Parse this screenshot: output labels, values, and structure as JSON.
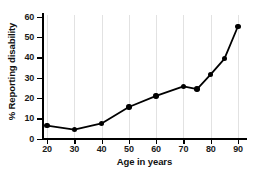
{
  "chart_data": {
    "type": "line",
    "title": "",
    "xlabel": "Age in years",
    "ylabel": "% Reporting disability",
    "x": [
      20,
      30,
      40,
      50,
      60,
      70,
      75,
      80,
      85,
      90
    ],
    "values": [
      6.3,
      4.4,
      7.4,
      15.5,
      21.0,
      25.6,
      24.3,
      31.5,
      39.2,
      55.2
    ],
    "series": [
      {
        "name": "% Reporting disability",
        "values": [
          6.3,
          4.4,
          7.4,
          15.5,
          21.0,
          25.6,
          24.3,
          31.5,
          39.2,
          55.2
        ]
      }
    ],
    "xlim": [
      20,
      90
    ],
    "ylim": [
      0,
      60
    ],
    "xticks": [
      20,
      30,
      40,
      50,
      60,
      70,
      80,
      90
    ],
    "xtick_labels": [
      "20",
      "30",
      "40",
      "50",
      "60",
      "70",
      "80",
      "90"
    ],
    "yticks": [
      0,
      10,
      20,
      30,
      40,
      50,
      60
    ],
    "ytick_labels": [
      "0",
      "10",
      "20",
      "30",
      "40",
      "50",
      "60"
    ],
    "grid": "vertical-only",
    "legend": "none",
    "marker": "filled-circle",
    "line_color": "#000000",
    "marker_color": "#000000",
    "grid_color": "#e2e2e2",
    "background_color": "#ffffff"
  }
}
